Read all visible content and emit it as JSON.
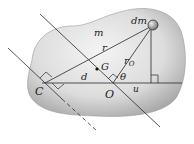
{
  "diagram": {
    "type": "rigid-body-moment-of-inertia",
    "colors": {
      "body_fill_light": "#f2f2f2",
      "body_fill_dark": "#a9a9a9",
      "line": "#2a2a2a",
      "mass_element": "#8a8a8a"
    },
    "labels": {
      "mass_element": "dm",
      "body_mass": "m",
      "radius": "r",
      "center_of_mass": "G",
      "radius_origin": "r",
      "radius_origin_sub": "O",
      "angle": "θ",
      "distance": "d",
      "horizontal_component": "u",
      "point_c": "C",
      "point_o": "O"
    }
  }
}
